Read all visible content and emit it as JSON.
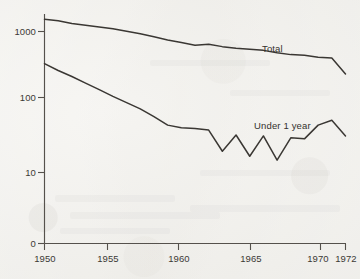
{
  "chart_data": {
    "type": "line",
    "title": "",
    "subtitle": "",
    "xlabel": "",
    "ylabel": "",
    "yscale": "log",
    "ylim": [
      6,
      2200
    ],
    "xlim": [
      1950,
      1972
    ],
    "grid": false,
    "legend_position": "inline-annotation",
    "y_ticks": [
      {
        "value": 1000,
        "label": "1000"
      },
      {
        "value": 100,
        "label": "100"
      },
      {
        "value": 10,
        "label": "10"
      },
      {
        "value": 0,
        "label": "0"
      }
    ],
    "x_ticks": [
      {
        "value": 1950,
        "label": "1950"
      },
      {
        "value": 1955,
        "label": "1955"
      },
      {
        "value": 1960,
        "label": "1960"
      },
      {
        "value": 1965,
        "label": "1965"
      },
      {
        "value": 1970,
        "label": "1970"
      },
      {
        "value": 1972,
        "label": "1972"
      }
    ],
    "x": [
      1950,
      1951,
      1952,
      1953,
      1954,
      1955,
      1956,
      1957,
      1958,
      1959,
      1960,
      1961,
      1962,
      1963,
      1964,
      1965,
      1966,
      1967,
      1968,
      1969,
      1970,
      1971,
      1972
    ],
    "series": [
      {
        "name": "Total",
        "label": "Total",
        "values": [
          1490,
          1420,
          1300,
          1230,
          1160,
          1090,
          1010,
          930,
          840,
          760,
          700,
          640,
          660,
          610,
          580,
          560,
          540,
          500,
          470,
          460,
          430,
          420,
          250
        ]
      },
      {
        "name": "Under 1 year",
        "label": "Under 1 year",
        "values": [
          350,
          280,
          230,
          185,
          150,
          120,
          98,
          80,
          62,
          47,
          43,
          42,
          40,
          20,
          34,
          17,
          33,
          15,
          31,
          30,
          47,
          55,
          33
        ]
      }
    ],
    "annotations": [
      {
        "name": "total-label",
        "text": "Total",
        "x": 1967,
        "series": "Total"
      },
      {
        "name": "under-one-year-label",
        "text": "Under 1 year",
        "x": 1966,
        "series": "Under 1 year"
      }
    ]
  },
  "axis": {
    "y_tick_labels": [
      "1000",
      "100",
      "10",
      "0"
    ],
    "x_tick_labels": [
      "1950",
      "1955",
      "1960",
      "1965",
      "1970",
      "1972"
    ]
  },
  "labels": {
    "total": "Total",
    "under_one_year": "Under 1 year"
  },
  "colors": {
    "line": "#3a3733",
    "axis": "#55514c",
    "text": "#3c3935",
    "paper": "#f2f1ee"
  }
}
